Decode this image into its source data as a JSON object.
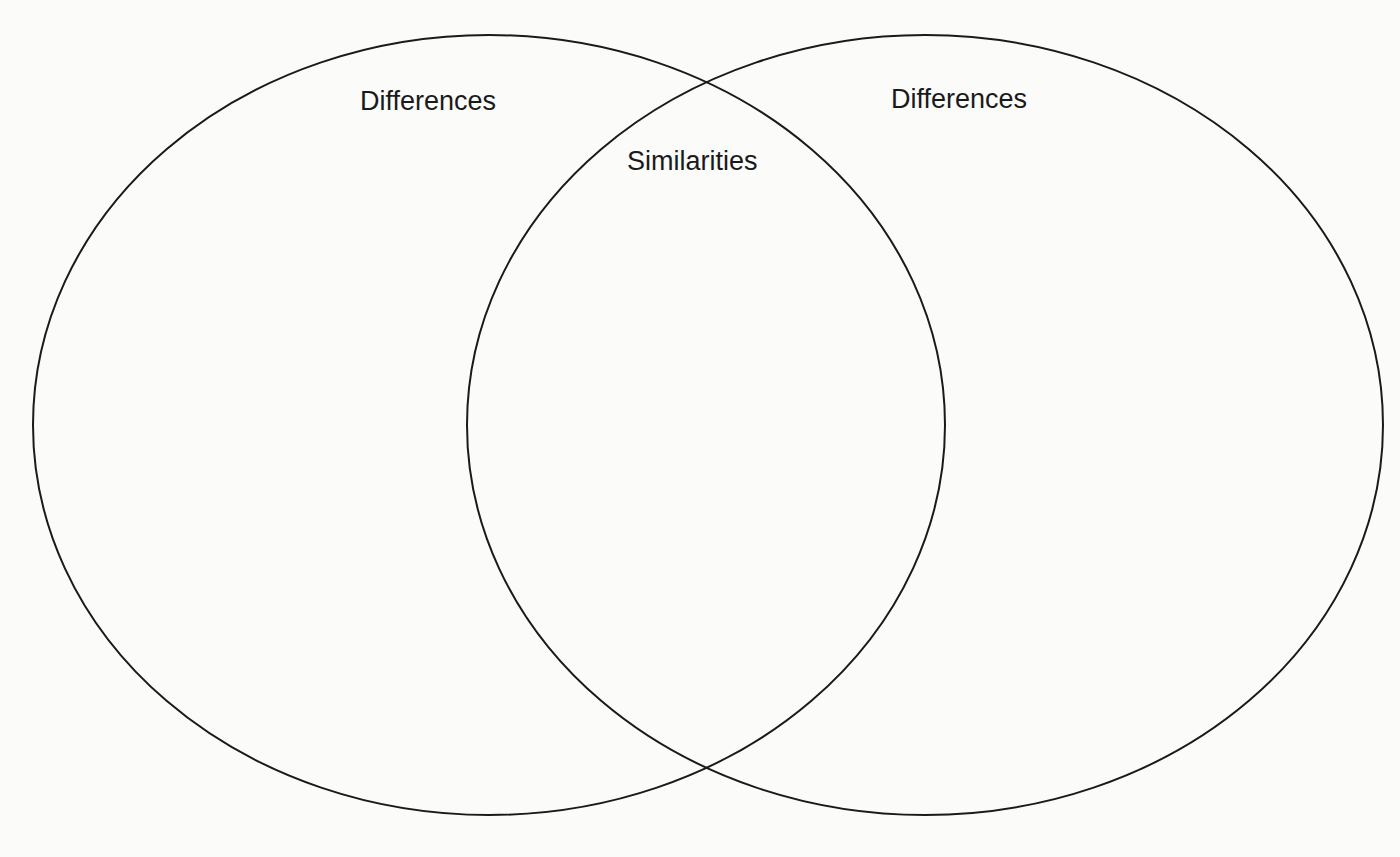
{
  "diagram": {
    "type": "venn",
    "stroke_color": "#1a1a1a",
    "background_color": "#fbfbfa",
    "circles": [
      {
        "id": "left",
        "cx": 489,
        "cy": 425,
        "rx": 456,
        "ry": 390
      },
      {
        "id": "right",
        "cx": 925,
        "cy": 425,
        "rx": 458,
        "ry": 390
      }
    ],
    "labels": {
      "left": "Differences",
      "middle": "Similarities",
      "right": "Differences"
    }
  }
}
